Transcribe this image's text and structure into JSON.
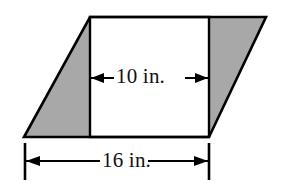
{
  "figure": {
    "type": "parallelogram-with-inscribed-rectangle",
    "background_color": "#ffffff",
    "outline_color": "#000000",
    "shaded_fill_color": "#a8a8a8",
    "unshaded_fill_color": "#ffffff",
    "parallelogram": {
      "name": "parallelogram-outline",
      "vertices": [
        {
          "x": 90,
          "y": 17
        },
        {
          "x": 266,
          "y": 17
        },
        {
          "x": 209,
          "y": 137
        },
        {
          "x": 24,
          "y": 137
        }
      ]
    },
    "rectangle": {
      "name": "inner-rectangle",
      "x": 90,
      "y": 17,
      "width": 119,
      "height": 120
    },
    "left_triangle": {
      "name": "left-shaded-triangle",
      "vertices": [
        {
          "x": 90,
          "y": 17
        },
        {
          "x": 90,
          "y": 137
        },
        {
          "x": 24,
          "y": 137
        }
      ]
    },
    "right_triangle": {
      "name": "right-shaded-triangle",
      "vertices": [
        {
          "x": 209,
          "y": 17
        },
        {
          "x": 266,
          "y": 17
        },
        {
          "x": 209,
          "y": 137
        }
      ]
    },
    "dimensions": [
      {
        "id": "inner-width",
        "label": "10 in.",
        "value": 10,
        "unit": "in.",
        "orientation": "horizontal",
        "arrow_y": 78,
        "arrow_x_start": 91,
        "arrow_x_end": 208,
        "arrow_style": "double-headed",
        "ticks": false
      },
      {
        "id": "base-width",
        "label": "16 in.",
        "value": 16,
        "unit": "in.",
        "orientation": "horizontal",
        "arrow_y": 161,
        "arrow_x_start": 25,
        "arrow_x_end": 209,
        "arrow_style": "double-headed",
        "ticks": true,
        "tick_y_top": 143,
        "tick_y_bottom": 180
      }
    ]
  }
}
